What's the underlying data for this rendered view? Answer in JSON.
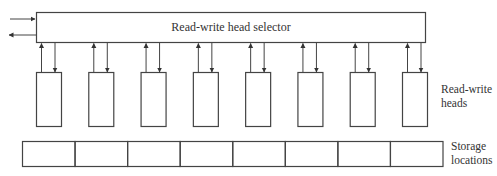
{
  "diagram": {
    "selector": {
      "label": "Read-write head selector"
    },
    "heads": {
      "label_line1": "Read-write",
      "label_line2": "heads",
      "count": 8
    },
    "storage": {
      "label_line1": "Storage",
      "label_line2": "locations",
      "count": 8
    },
    "colors": {
      "stroke": "#444444",
      "text": "#333333",
      "background": "#ffffff"
    }
  }
}
